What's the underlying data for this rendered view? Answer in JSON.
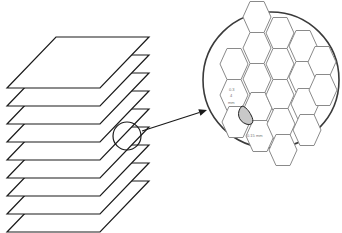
{
  "diagram": {
    "stack": {
      "layer_count": 9,
      "first_top_y": 37,
      "spacing": 18,
      "parallelogram": {
        "top_left_x": 56,
        "top_right_x": 149,
        "skew": 49,
        "depth": 51
      }
    },
    "magnifier": {
      "cx": 127,
      "cy": 136,
      "r": 14
    },
    "arrow": {
      "x1": 142,
      "y1": 131,
      "x2": 207,
      "y2": 110
    },
    "detail_view": {
      "cx": 271,
      "cy": 80,
      "r": 68,
      "hex_half_width": 14,
      "hex_height": 31,
      "labels": {
        "vertical_dim_1": "0.3",
        "vertical_dim_2": "4",
        "vertical_dim_unit": "mm",
        "horizontal_dim": "0.15 mm"
      },
      "colors": {
        "hex_stroke": "#8a8a8a",
        "circle_stroke": "#3a3a3a",
        "highlight_fill": "#c8c8c8"
      }
    }
  }
}
